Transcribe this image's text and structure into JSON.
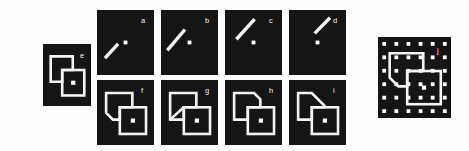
{
  "figure": {
    "background_color": "#fdfdfd",
    "panel_color": "#151515",
    "ink_color": "#f4f4f4",
    "dot_color": "#ffffff",
    "label_color": "#f2f2f2"
  },
  "panels": [
    {
      "id": "e",
      "label": "e",
      "type": "two-overlapping-squares",
      "group": "left",
      "x": 43,
      "y": 44,
      "w": 48,
      "h": 62,
      "label_x": 80,
      "label_y": 52,
      "description": "Two outlined squares overlapping; the front (lower-right) square is complete and contains a central white dot; the rear (upper-left) square is occluded by the front square.",
      "center_dot": true,
      "has_grid_dots": false,
      "line_segment": null
    },
    {
      "id": "a",
      "label": "a",
      "type": "line-and-dot",
      "group": "top-row",
      "x": 97,
      "y": 10,
      "w": 57,
      "h": 65,
      "label_x": 141,
      "label_y": 17,
      "description": "A short white oblique bar in the lower-left quadrant, tilted about 40 degrees from horizontal, plus a white dot near the centre.",
      "center_dot": true,
      "has_grid_dots": false,
      "line_segment": {
        "x1": 0.14,
        "y1": 0.74,
        "x2": 0.37,
        "y2": 0.52,
        "angle_deg": 43
      }
    },
    {
      "id": "b",
      "label": "b",
      "type": "line-and-dot",
      "group": "top-row",
      "x": 161,
      "y": 10,
      "w": 57,
      "h": 65,
      "label_x": 205,
      "label_y": 17,
      "description": "A white oblique bar running from lower-left to upper-right in the left half of the panel, plus a white dot at the centre.",
      "center_dot": true,
      "has_grid_dots": false,
      "line_segment": {
        "x1": 0.11,
        "y1": 0.62,
        "x2": 0.42,
        "y2": 0.3,
        "angle_deg": 45
      }
    },
    {
      "id": "c",
      "label": "c",
      "type": "line-and-dot",
      "group": "top-row",
      "x": 225,
      "y": 10,
      "w": 57,
      "h": 65,
      "label_x": 269,
      "label_y": 17,
      "description": "A white oblique bar high in the panel running from lower-left to upper-right, plus a white dot at the centre.",
      "center_dot": true,
      "has_grid_dots": false,
      "line_segment": {
        "x1": 0.2,
        "y1": 0.45,
        "x2": 0.52,
        "y2": 0.14,
        "angle_deg": 45
      }
    },
    {
      "id": "d",
      "label": "d",
      "type": "line-and-dot",
      "group": "top-row",
      "x": 289,
      "y": 10,
      "w": 57,
      "h": 65,
      "label_x": 333,
      "label_y": 17,
      "description": "A short white oblique bar in the upper-right quadrant, plus a white dot at the centre.",
      "center_dot": true,
      "has_grid_dots": false,
      "line_segment": {
        "x1": 0.45,
        "y1": 0.36,
        "x2": 0.72,
        "y2": 0.12,
        "angle_deg": 42
      }
    },
    {
      "id": "f",
      "label": "f",
      "type": "two-overlapping-squares",
      "group": "bottom-row",
      "x": 97,
      "y": 80,
      "w": 57,
      "h": 65,
      "label_x": 141,
      "label_y": 87,
      "description": "Overlapping squares where the rear square's lower-left corner is cut off by a short diagonal, producing a folded-corner appearance; front square carries a central dot.",
      "center_dot": true,
      "has_grid_dots": false,
      "corner_cut": "bottom-left",
      "line_segment": null
    },
    {
      "id": "g",
      "label": "g",
      "type": "two-overlapping-squares",
      "group": "bottom-row",
      "x": 161,
      "y": 80,
      "w": 57,
      "h": 65,
      "label_x": 205,
      "label_y": 87,
      "description": "Overlapping squares with a long diagonal line drawn across the rear square from its lower-left corner to its upper-right region; front square carries a central dot.",
      "center_dot": true,
      "has_grid_dots": false,
      "corner_cut": "diagonal-across",
      "line_segment": null
    },
    {
      "id": "h",
      "label": "h",
      "type": "two-overlapping-squares",
      "group": "bottom-row",
      "x": 225,
      "y": 80,
      "w": 57,
      "h": 65,
      "label_x": 269,
      "label_y": 87,
      "description": "Overlapping squares where the rear square's upper-right corner is replaced by a short diagonal bevel; front square carries a central dot.",
      "center_dot": true,
      "has_grid_dots": false,
      "corner_cut": "top-right-small",
      "line_segment": null
    },
    {
      "id": "i",
      "label": "i",
      "type": "two-overlapping-squares",
      "group": "bottom-row",
      "x": 289,
      "y": 80,
      "w": 57,
      "h": 65,
      "label_x": 333,
      "label_y": 87,
      "description": "Overlapping squares where the rear square's upper-right corner is cut by a large diagonal bevel; front square carries a central dot.",
      "center_dot": true,
      "has_grid_dots": false,
      "corner_cut": "top-right-large",
      "line_segment": null
    },
    {
      "id": "j",
      "label": "j",
      "type": "two-overlapping-squares-on-dot-grid",
      "group": "right",
      "x": 378,
      "y": 37,
      "w": 73,
      "h": 81,
      "label_x": 437,
      "label_y": 47,
      "description": "The overlapping-squares figure superimposed on a regular 6 by 6 array of white square dots on a black field; the front square carries a central dot.",
      "center_dot": true,
      "has_grid_dots": true,
      "grid_cols": 6,
      "grid_rows": 6,
      "corner_cut": "bottom-left",
      "line_segment": null
    }
  ]
}
